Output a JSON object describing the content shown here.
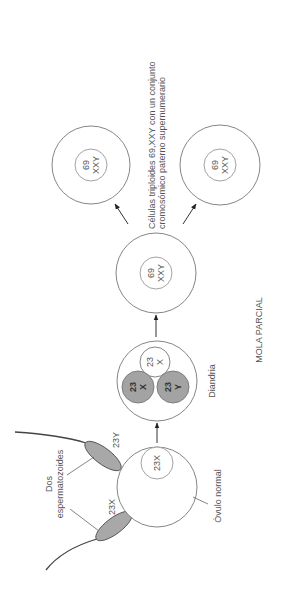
{
  "diagram": {
    "title": "MOLA PARCIAL",
    "labels": {
      "sperm_group": "Dos espermatozoides",
      "sperm_group_line1": "Dos",
      "sperm_group_line2": "espermatozoides",
      "sperm_a": "23X",
      "sperm_b": "23Y",
      "ovum": "Óvulo normal",
      "ovum_nucleus": "23X",
      "diandry": "Diandria",
      "result_line1": "Células triploides 69,XXY con un conjunto",
      "result_line2": "cromosómico paterno supernumerario"
    },
    "diandry_pronuclei": [
      {
        "number": "23",
        "sex": "X",
        "shade": "white"
      },
      {
        "number": "23",
        "sex": "X",
        "shade": "gray"
      },
      {
        "number": "23",
        "sex": "Y",
        "shade": "gray"
      }
    ],
    "triploid_cells": [
      {
        "number": "69",
        "karyotype": "XXY"
      },
      {
        "number": "69",
        "karyotype": "XXY"
      },
      {
        "number": "69",
        "karyotype": "XXY"
      }
    ],
    "colors": {
      "stroke": "#777777",
      "gray_fill": "#a3a3a3",
      "text": "#555555"
    }
  }
}
